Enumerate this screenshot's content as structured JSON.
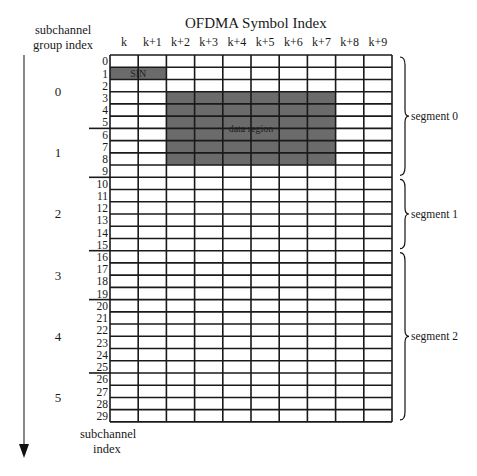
{
  "diagram": {
    "title": "OFDMA Symbol Index",
    "left_axis_label_line1": "subchannel",
    "left_axis_label_line2": "group index",
    "bottom_axis_label_line1": "subchannel",
    "bottom_axis_label_line2": "index",
    "columns": [
      "k",
      "k+1",
      "k+2",
      "k+3",
      "k+4",
      "k+5",
      "k+6",
      "k+7",
      "k+8",
      "k+9"
    ],
    "rows": [
      "0",
      "1",
      "2",
      "3",
      "4",
      "5",
      "6",
      "7",
      "8",
      "9",
      "10",
      "11",
      "12",
      "13",
      "14",
      "15",
      "16",
      "17",
      "18",
      "19",
      "20",
      "21",
      "22",
      "23",
      "24",
      "25",
      "26",
      "27",
      "28",
      "29"
    ],
    "groups": [
      {
        "label": "0",
        "start_row": 0,
        "end_row": 5
      },
      {
        "label": "1",
        "start_row": 6,
        "end_row": 9
      },
      {
        "label": "2",
        "start_row": 10,
        "end_row": 15
      },
      {
        "label": "3",
        "start_row": 16,
        "end_row": 19
      },
      {
        "label": "4",
        "start_row": 20,
        "end_row": 25
      },
      {
        "label": "5",
        "start_row": 26,
        "end_row": 29
      }
    ],
    "segments": [
      {
        "label": "segment 0",
        "start_row": 0,
        "end_row": 9
      },
      {
        "label": "segment 1",
        "start_row": 10,
        "end_row": 15
      },
      {
        "label": "segment 2",
        "start_row": 16,
        "end_row": 29
      }
    ],
    "regions": [
      {
        "label": "SIN",
        "start_col": 0,
        "end_col": 1,
        "start_row": 1,
        "end_row": 1
      },
      {
        "label": "data region",
        "start_col": 2,
        "end_col": 7,
        "start_row": 3,
        "end_row": 8
      }
    ],
    "colors": {
      "grid_line": "#1a1a1a",
      "fill": "#6b6b6b",
      "arrow": "#555555",
      "text": "#1a1a1a"
    }
  }
}
